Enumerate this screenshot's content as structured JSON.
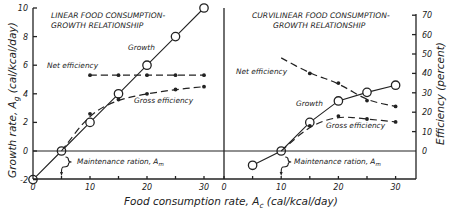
{
  "chart_data": [
    {
      "type": "line",
      "title": "LINEAR FOOD CONSUMPTION- GROWTH RELATIONSHIP",
      "title_lines": [
        "LINEAR FOOD CONSUMPTION-",
        "GROWTH RELATIONSHIP"
      ],
      "xlabel": "Food consumption rate, Ac (cal/kcal/day)",
      "ylabel": "Growth rate, Ag (cal/kcal/day)",
      "xlim": [
        0,
        30
      ],
      "ylim": [
        -2,
        10
      ],
      "xticks": [
        0,
        10,
        20,
        30
      ],
      "yticks": [
        -2,
        0,
        2,
        4,
        6,
        8,
        10
      ],
      "series": [
        {
          "name": "Growth",
          "marker": "open-circle",
          "line": "solid",
          "x": [
            0,
            5,
            10,
            15,
            20,
            25,
            30
          ],
          "y": [
            -2,
            0,
            2,
            4,
            6,
            8,
            10
          ]
        },
        {
          "name": "Net efficiency",
          "marker": "dot",
          "line": "dashed",
          "x": [
            10,
            15,
            20,
            25,
            30
          ],
          "y": [
            5.3,
            5.3,
            5.3,
            5.3,
            5.3
          ],
          "axis": "left-scale-units"
        },
        {
          "name": "Gross efficiency",
          "marker": "dot",
          "line": "dashed",
          "x": [
            5,
            10,
            15,
            20,
            25,
            30
          ],
          "y": [
            0,
            2.6,
            3.6,
            4.0,
            4.3,
            4.5
          ],
          "axis": "left-scale-units"
        }
      ],
      "annotations": [
        "Growth",
        "Net efficiency",
        "Gross efficiency",
        "Maintenance ration, Am"
      ],
      "maintenance_ration_x": 5
    },
    {
      "type": "line",
      "title": "CURVILINEAR FOOD CONSUMPTION- GROWTH RELATIONSHIP",
      "title_lines": [
        "CURVILINEAR FOOD CONSUMPTION-",
        "GROWTH RELATIONSHIP"
      ],
      "xlabel": "Food consumption rate, Ac (cal/kcal/day)",
      "ylabel_right": "Efficiency (percent)",
      "xlim": [
        0,
        30
      ],
      "ylim": [
        -2,
        10
      ],
      "ylim_right": [
        0,
        70
      ],
      "xticks": [
        0,
        10,
        20,
        30
      ],
      "yticks_right": [
        0,
        10,
        20,
        30,
        40,
        50,
        60,
        70
      ],
      "series": [
        {
          "name": "Growth",
          "marker": "open-circle",
          "line": "solid",
          "x": [
            5,
            10,
            15,
            20,
            25,
            30
          ],
          "y": [
            -1.0,
            0,
            2.0,
            3.5,
            4.1,
            4.6
          ]
        },
        {
          "name": "Net efficiency",
          "marker": "dot",
          "line": "dashed",
          "axis": "right",
          "x": [
            10,
            15,
            20,
            25,
            30
          ],
          "y": [
            48,
            40,
            35,
            26,
            23
          ]
        },
        {
          "name": "Gross efficiency",
          "marker": "dot",
          "line": "dashed",
          "axis": "right",
          "x": [
            10,
            15,
            20,
            25,
            30
          ],
          "y": [
            0,
            13,
            18,
            16.5,
            15
          ]
        }
      ],
      "annotations": [
        "Net efficiency",
        "Growth",
        "Gross efficiency",
        "Maintenance ration, Am"
      ],
      "maintenance_ration_x": 10
    }
  ],
  "labels": {
    "left_title_1": "LINEAR FOOD CONSUMPTION-",
    "left_title_2": "GROWTH RELATIONSHIP",
    "right_title_1": "CURVILINEAR FOOD CONSUMPTION-",
    "right_title_2": "GROWTH RELATIONSHIP",
    "growth": "Growth",
    "net_eff": "Net efficiency",
    "gross_eff": "Gross efficiency",
    "maintenance": "Maintenance ration, A",
    "maintenance_sub": "m",
    "xlabel_main": "Food  consumption rate, A",
    "xlabel_sub": "c",
    "xlabel_units": " (cal/kcal/day)",
    "ylabel_left_main": "Growth rate, A",
    "ylabel_left_sub": "g",
    "ylabel_left_units": " (cal/kcal/day)",
    "ylabel_right": "Efficiency (percent)"
  }
}
